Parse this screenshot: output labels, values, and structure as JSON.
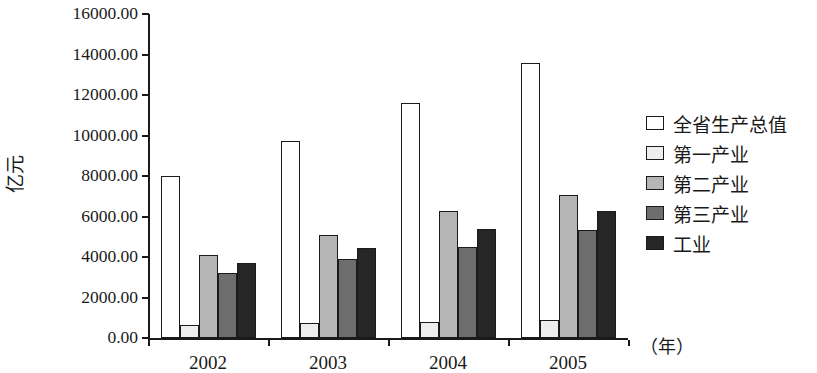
{
  "chart_data": {
    "type": "bar",
    "title": "",
    "xlabel": "（年）",
    "ylabel": "亿元",
    "categories": [
      "2002",
      "2003",
      "2004",
      "2005"
    ],
    "ylim": [
      0,
      16000
    ],
    "ytick_values": [
      0,
      2000,
      4000,
      6000,
      8000,
      10000,
      12000,
      14000,
      16000
    ],
    "ytick_labels": [
      "0.00",
      "2000.00",
      "4000.00",
      "6000.00",
      "8000.00",
      "10000.00",
      "12000.00",
      "14000.00",
      "16000.00"
    ],
    "grid": false,
    "legend_position": "right",
    "series": [
      {
        "name": "全省生产总值",
        "color": "#ffffff",
        "values": [
          8000,
          9750,
          11600,
          13600
        ]
      },
      {
        "name": "第一产业",
        "color": "#eeeeee",
        "values": [
          650,
          720,
          780,
          880
        ]
      },
      {
        "name": "第二产业",
        "color": "#b5b5b5",
        "values": [
          4100,
          5080,
          6250,
          7080
        ]
      },
      {
        "name": "第三产业",
        "color": "#6e6e6e",
        "values": [
          3230,
          3900,
          4500,
          5330
        ]
      },
      {
        "name": "工业",
        "color": "#262626",
        "values": [
          3680,
          4450,
          5400,
          6280
        ]
      }
    ]
  }
}
